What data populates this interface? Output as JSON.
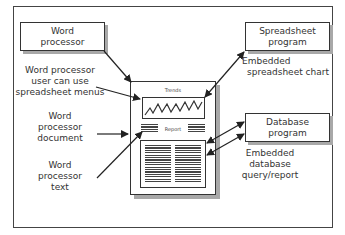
{
  "diagram": {
    "boxes": {
      "word_processor": {
        "line1": "Word",
        "line2": "processor"
      },
      "spreadsheet_program": {
        "line1": "Spreadsheet",
        "line2": "program"
      },
      "database_program": {
        "line1": "Database",
        "line2": "program"
      }
    },
    "labels": {
      "menus": {
        "line1": "Word processor",
        "line2": "user can use",
        "line3": "spreadsheet menus"
      },
      "document": {
        "line1": "Word",
        "line2": "processor",
        "line3": "document"
      },
      "text": {
        "line1": "Word",
        "line2": "processor",
        "line3": "text"
      },
      "embedded_chart": {
        "line1": "Embedded",
        "line2": "spreadsheet chart"
      },
      "embedded_db": {
        "line1": "Embedded",
        "line2": "database",
        "line3": "query/report"
      }
    },
    "document": {
      "chart_title": "Trends",
      "report_label": "Report"
    },
    "colors": {
      "stroke": "#333333",
      "shadow": "#a8a8a8",
      "background": "#ffffff"
    }
  }
}
